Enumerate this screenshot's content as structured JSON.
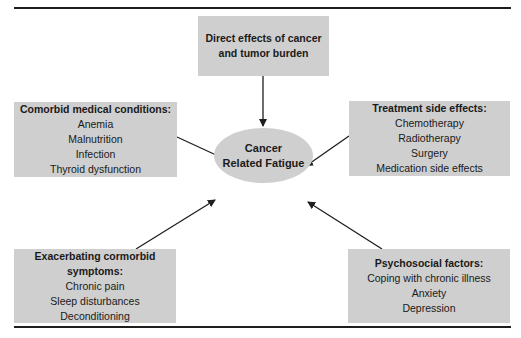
{
  "diagram": {
    "center": {
      "line1": "Cancer",
      "line2": "Related Fatigue"
    },
    "nodes": {
      "direct": {
        "title_line1": "Direct effects of cancer",
        "title_line2": "and tumor burden"
      },
      "comorbid": {
        "title": "Comorbid medical conditions:",
        "items": [
          "Anemia",
          "Malnutrition",
          "Infection",
          "Thyroid dysfunction"
        ]
      },
      "treatment": {
        "title": "Treatment side effects:",
        "items": [
          "Chemotherapy",
          "Radiotherapy",
          "Surgery",
          "Medication side effects"
        ]
      },
      "exacerbating": {
        "title_line1": "Exacerbating cormorbid",
        "title_line2": "symptoms:",
        "items": [
          "Chronic pain",
          "Sleep disturbances",
          "Deconditioning"
        ]
      },
      "psychosocial": {
        "title": "Psychosocial factors:",
        "items": [
          "Coping with chronic illness",
          "Anxiety",
          "Depression"
        ]
      }
    },
    "colors": {
      "box_fill": "#cfcfcf",
      "line": "#1e1e1e"
    }
  }
}
